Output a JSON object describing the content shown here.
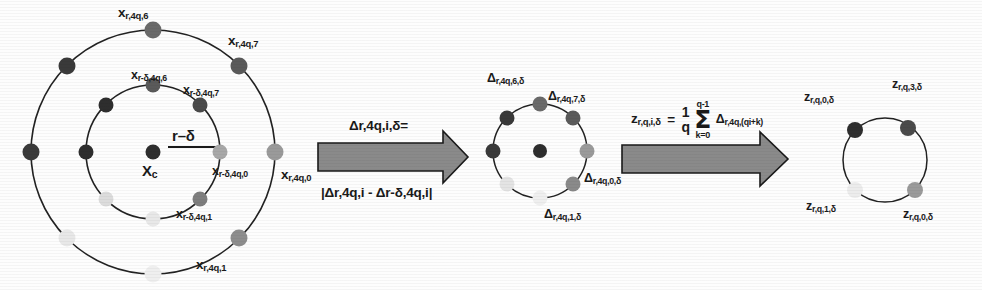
{
  "figure": {
    "background_color": "#fdfdfd",
    "stroke_color": "#222222",
    "arrow_fill": "#8a8a8a",
    "arrow_stroke": "#1a1a1a"
  },
  "panel_left": {
    "name": "concentric-sampling-circles",
    "center_label": "X",
    "center_label_sub": "c",
    "radius_label": "r–δ",
    "outer_circle": {
      "center": [
        153,
        152
      ],
      "radius": 122,
      "point_count": 8,
      "labels": [
        {
          "text_main": "x",
          "text_sub": "r,4q,0",
          "x": 281,
          "y": 175
        },
        {
          "text_main": "x",
          "text_sub": "r,4q,1",
          "x": 196,
          "y": 265
        },
        {
          "text_main": "x",
          "text_sub": "r,4q,6",
          "x": 118,
          "y": 10
        },
        {
          "text_main": "x",
          "text_sub": "r,4q,7",
          "x": 228,
          "y": 38
        }
      ],
      "dot_colors": [
        "#9a9a9a",
        "#8e8e8e",
        "#efefef",
        "#e8e8e8",
        "#3a3a3a",
        "#3a3a3a",
        "#6a6a6a",
        "#5a5a5a"
      ]
    },
    "inner_circle": {
      "center": [
        153,
        152
      ],
      "radius": 67,
      "point_count": 8,
      "labels": [
        {
          "text_main": "x",
          "text_sub": "r-δ,4q,0",
          "x": 219,
          "y": 168
        },
        {
          "text_main": "x",
          "text_sub": "r-δ,4q,1",
          "x": 178,
          "y": 213
        },
        {
          "text_main": "x",
          "text_sub": "r-δ,4q,6",
          "x": 132,
          "y": 74
        },
        {
          "text_main": "x",
          "text_sub": "r-δ,4q,7",
          "x": 185,
          "y": 88
        }
      ],
      "dot_colors": [
        "#a8a8a8",
        "#7e7e7e",
        "#e8e8e8",
        "#dcdcdc",
        "#2e2e2e",
        "#2e2e2e",
        "#5a5a5a",
        "#4a4a4a"
      ]
    }
  },
  "arrow_1": {
    "name": "delta-transform-arrow",
    "formula_top": "Δr,4q,i,δ=",
    "formula_bottom": "|Δr,4q,i - Δr-δ,4q,i|"
  },
  "panel_middle": {
    "name": "delta-circle",
    "circle": {
      "center": [
        540,
        151
      ],
      "radius": 47,
      "point_count": 8
    },
    "has_center_dot": true,
    "labels": [
      {
        "text": "Δ",
        "sub": "r,4q,0,δ",
        "x": 588,
        "y": 178
      },
      {
        "text": "Δ",
        "sub": "r,4q,1,δ",
        "x": 547,
        "y": 215
      },
      {
        "text": "Δ",
        "sub": "r,4q,6,δ",
        "x": 489,
        "y": 79
      },
      {
        "text": "Δ",
        "sub": "r,4q,7,δ",
        "x": 550,
        "y": 96
      }
    ],
    "dot_colors": [
      "#9a9a9a",
      "#8a8a8a",
      "#efefef",
      "#e4e4e4",
      "#3a3a3a",
      "#3a3a3a",
      "#6a6a6a",
      "#5a5a5a"
    ],
    "center_dot_color": "#2e2e2e"
  },
  "arrow_2": {
    "name": "averaging-arrow",
    "formula_lhs": "z",
    "formula_lhs_sub": "r,q,i,δ",
    "formula_equals": "=",
    "fraction_num": "1",
    "fraction_den": "q",
    "sigma_top": "q-1",
    "sigma_symbol": "Σ",
    "sigma_bottom": "k=0",
    "sigma_operand": "Δ",
    "sigma_operand_sub": "r,4q,(qi+k)"
  },
  "panel_right": {
    "name": "z-circle",
    "circle": {
      "center": [
        885,
        160
      ],
      "radius": 42,
      "point_count": 4
    },
    "has_center_dot": false,
    "labels": [
      {
        "text": "z",
        "sub": "r,q,0,δ",
        "x": 906,
        "y": 215
      },
      {
        "text": "z",
        "sub": "r,q,1,δ",
        "x": 808,
        "y": 207
      },
      {
        "text": "z",
        "sub": "r,q,0,δ",
        "x": 806,
        "y": 96
      },
      {
        "text": "z",
        "sub": "r,q,3,δ",
        "x": 894,
        "y": 83
      }
    ],
    "dot_colors": [
      "#9a9a9a",
      "#ececec",
      "#2e2e2e",
      "#4a4a4a"
    ]
  }
}
